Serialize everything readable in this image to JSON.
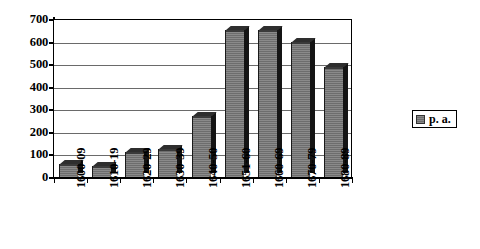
{
  "chart_data": {
    "type": "bar",
    "title": "",
    "subtitle": "",
    "xlabel": "",
    "ylabel": "",
    "categories": [
      "1600-09",
      "1610-19",
      "1620-29",
      "1630-39",
      "1640-50",
      "1651-60",
      "1660-69",
      "1670-79",
      "1680-89"
    ],
    "values": [
      58,
      50,
      112,
      126,
      272,
      652,
      652,
      598,
      487
    ],
    "series": [
      {
        "name": "p. a.",
        "values": [
          58,
          50,
          112,
          126,
          272,
          652,
          652,
          598,
          487
        ]
      }
    ],
    "ylim": [
      0,
      700
    ],
    "yticks": [
      0,
      100,
      200,
      300,
      400,
      500,
      600,
      700
    ],
    "ytick_labels": [
      "0",
      "100",
      "200",
      "300",
      "400",
      "500",
      "600",
      "700"
    ],
    "grid": true,
    "grid_axis": "y",
    "legend": {
      "position": "right",
      "entries": [
        {
          "label": "p. a.",
          "color": "#7a7a7a"
        }
      ]
    },
    "style": {
      "bar_face_color": "#7a7a7a",
      "bar_side_color": "#141414",
      "bar_top_color": "#2e2e2e",
      "axis_color": "#000000",
      "grid_color": "#6a6a6a",
      "background": "#ffffff",
      "three_d": true
    }
  },
  "legend": {
    "swatch_name": "legend-color-swatch",
    "label": "p. a."
  }
}
